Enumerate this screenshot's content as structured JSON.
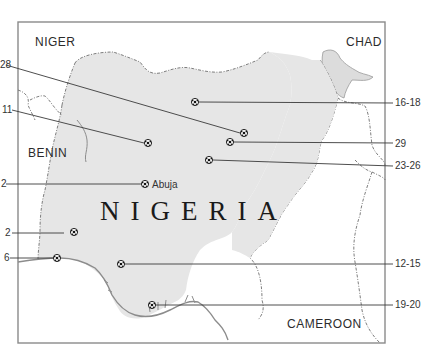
{
  "map": {
    "title": "NIGERIA",
    "colors": {
      "background": "#ffffff",
      "frame": "#8a8a8a",
      "nigeria_fill": "#e6e6e6",
      "lake_fill": "#dcdcdc",
      "border_stroke": "#6f6f6f",
      "coast_stroke": "#8c8c8c",
      "leader_line": "#3a3a3a",
      "text": "#2b2b2b"
    },
    "neighbors": [
      {
        "name": "NIGER"
      },
      {
        "name": "CHAD"
      },
      {
        "name": "BENIN"
      },
      {
        "name": "CAMEROON"
      }
    ],
    "cities": [
      {
        "name": "Abuja"
      }
    ],
    "callouts_left": [
      {
        "label": "28"
      },
      {
        "label": "11"
      },
      {
        "label": "2"
      },
      {
        "label": "2"
      },
      {
        "label": "6"
      }
    ],
    "callouts_right": [
      {
        "label": "16-18"
      },
      {
        "label": "29"
      },
      {
        "label": "23-26"
      },
      {
        "label": "12-15"
      },
      {
        "label": "19-20"
      }
    ],
    "markers": [
      {
        "icon": "football-icon",
        "callout": "16-18"
      },
      {
        "icon": "football-icon",
        "callout": "28"
      },
      {
        "icon": "football-icon",
        "callout": "29"
      },
      {
        "icon": "football-icon",
        "callout": "23-26"
      },
      {
        "icon": "football-icon",
        "callout": "11"
      },
      {
        "icon": "football-icon",
        "callout": "2",
        "city": "Abuja"
      },
      {
        "icon": "football-icon",
        "callout": "2"
      },
      {
        "icon": "football-icon",
        "callout": "6"
      },
      {
        "icon": "football-icon",
        "callout": "12-15"
      },
      {
        "icon": "football-icon",
        "callout": "19-20"
      }
    ]
  }
}
